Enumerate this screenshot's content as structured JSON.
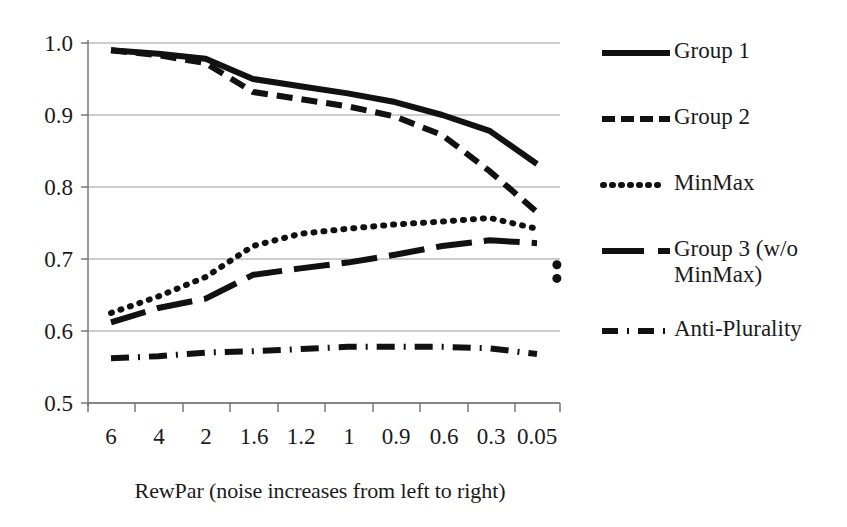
{
  "chart_data": {
    "type": "line",
    "title": "",
    "xlabel": "RewPar (noise increases from left to right)",
    "ylabel": "",
    "categories": [
      "6",
      "4",
      "2",
      "1.6",
      "1.2",
      "1",
      "0.9",
      "0.6",
      "0.3",
      "0.05"
    ],
    "ylim": [
      0.5,
      1.0
    ],
    "yticks": [
      "0.5",
      "0.6",
      "0.7",
      "0.8",
      "0.9",
      "1.0"
    ],
    "grid": true,
    "legend_position": "right",
    "series": [
      {
        "name": "Group 1",
        "style": "solid",
        "values": [
          0.99,
          0.985,
          0.978,
          0.95,
          0.94,
          0.93,
          0.918,
          0.9,
          0.878,
          0.832
        ]
      },
      {
        "name": "Group 2",
        "style": "dashed",
        "values": [
          0.99,
          0.983,
          0.972,
          0.932,
          0.922,
          0.912,
          0.898,
          0.872,
          0.822,
          0.765
        ]
      },
      {
        "name": "MinMax",
        "style": "dotted",
        "values": [
          0.625,
          0.648,
          0.675,
          0.718,
          0.735,
          0.742,
          0.748,
          0.752,
          0.757,
          0.742
        ]
      },
      {
        "name": "Group 3 (w/o\nMinMax)",
        "style": "longdash",
        "values": [
          0.612,
          0.632,
          0.645,
          0.678,
          0.687,
          0.695,
          0.706,
          0.718,
          0.726,
          0.722
        ]
      },
      {
        "name": "Anti-Plurality",
        "style": "dashdot",
        "values": [
          0.562,
          0.565,
          0.57,
          0.572,
          0.575,
          0.578,
          0.578,
          0.578,
          0.576,
          0.568
        ]
      }
    ],
    "extra_points": [
      {
        "series": "MinMax",
        "x": "beyond-0.05",
        "value": 0.673
      },
      {
        "series": "Group 3 (w/o MinMax)",
        "x": "beyond-0.05",
        "value": 0.692
      }
    ],
    "line_color": "#111111"
  },
  "legend": {
    "items": [
      {
        "label": "Group 1",
        "sample": "solid-line-sample"
      },
      {
        "label": "Group 2",
        "sample": "dashed-line-sample"
      },
      {
        "label": "MinMax",
        "sample": "dotted-line-sample"
      },
      {
        "label": "Group 3 (w/o\nMinMax)",
        "sample": "longdash-line-sample"
      },
      {
        "label": "Anti-Plurality",
        "sample": "dashdot-line-sample"
      }
    ]
  },
  "axis": {
    "x_caption": "RewPar (noise increases from left to right)",
    "y_labels": [
      "1.0",
      "0.9",
      "0.8",
      "0.7",
      "0.6",
      "0.5"
    ],
    "x_labels": [
      "6",
      "4",
      "2",
      "1.6",
      "1.2",
      "1",
      "0.9",
      "0.6",
      "0.3",
      "0.05"
    ]
  }
}
